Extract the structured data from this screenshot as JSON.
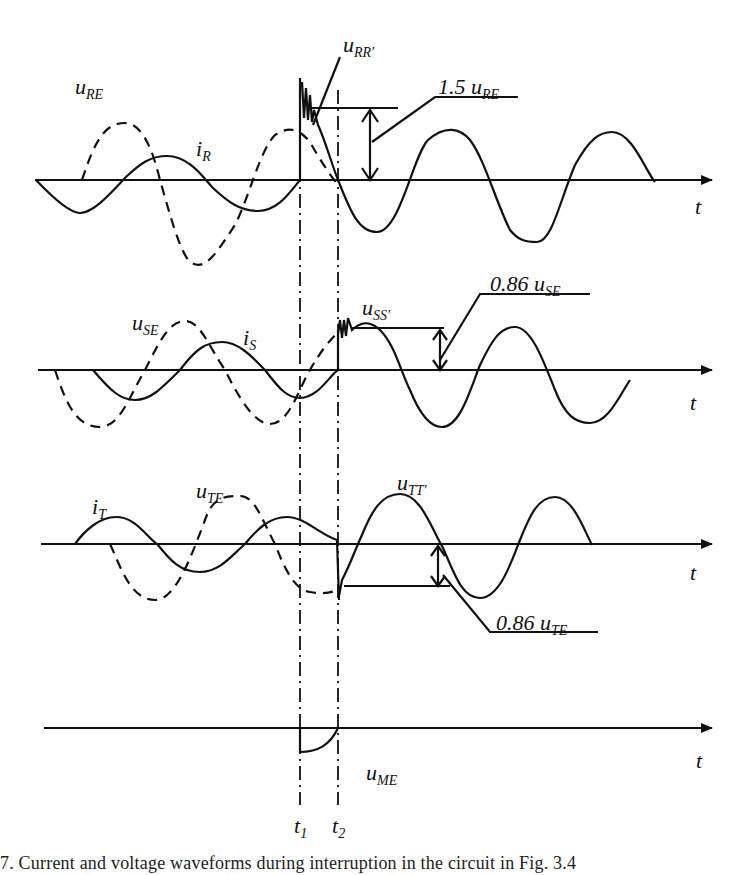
{
  "figure": {
    "caption": "7. Current and voltage waveforms during interruption in the circuit in Fig. 3.4",
    "time_markers": {
      "t1": "t",
      "t1_sub": "1",
      "t2": "t",
      "t2_sub": "2"
    },
    "axis_label": "t",
    "panels": [
      {
        "id": "R",
        "voltage": {
          "sym": "u",
          "sub": "RE"
        },
        "current": {
          "sym": "i",
          "sub": "R"
        },
        "recovery": {
          "sym": "u",
          "sub": "RR'"
        },
        "annotation": {
          "prefix": "1.5 ",
          "sym": "u",
          "sub": "RE"
        }
      },
      {
        "id": "S",
        "voltage": {
          "sym": "u",
          "sub": "SE"
        },
        "current": {
          "sym": "i",
          "sub": "S"
        },
        "recovery": {
          "sym": "u",
          "sub": "SS'"
        },
        "annotation": {
          "prefix": "0.86 ",
          "sym": "u",
          "sub": "SE"
        }
      },
      {
        "id": "T",
        "voltage": {
          "sym": "u",
          "sub": "TE"
        },
        "current": {
          "sym": "i",
          "sub": "T"
        },
        "recovery": {
          "sym": "u",
          "sub": "TT'"
        },
        "annotation": {
          "prefix": "0.86 ",
          "sym": "u",
          "sub": "TE"
        }
      },
      {
        "id": "M",
        "voltage": {
          "sym": "u",
          "sub": "ME"
        }
      }
    ]
  },
  "colors": {
    "ink": "#111111",
    "background": "#ffffff"
  }
}
